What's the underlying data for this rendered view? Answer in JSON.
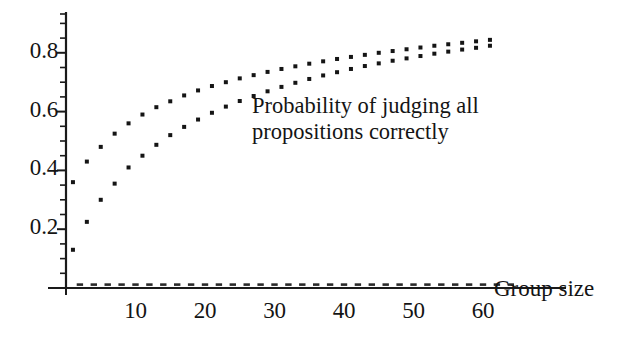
{
  "chart_data": {
    "type": "scatter",
    "title": "",
    "subtitle": "",
    "xlabel": "Group size",
    "ylabel": "",
    "annotation": "Probability of judging all propositions correctly",
    "annotation_lines": [
      "Probability of judging all",
      "propositions correctly"
    ],
    "xlim": [
      0,
      65
    ],
    "ylim": [
      0,
      0.93
    ],
    "xticks": [
      10,
      20,
      30,
      40,
      50,
      60
    ],
    "xtick_labels": [
      "10",
      "20",
      "30",
      "40",
      "50",
      "60"
    ],
    "yticks": [
      0.2,
      0.4,
      0.6,
      0.8
    ],
    "ytick_labels": [
      "0.2",
      "0.4",
      "0.6",
      "0.8"
    ],
    "y_minor_ticks": [
      0.05,
      0.1,
      0.15,
      0.25,
      0.3,
      0.35,
      0.45,
      0.5,
      0.55,
      0.65,
      0.7,
      0.75,
      0.85,
      0.9
    ],
    "grid": false,
    "legend": "none",
    "marker": "square",
    "marker_color": "#151515",
    "marker_size_px": 4,
    "series": [
      {
        "name": "upper",
        "x": [
          1,
          3,
          5,
          7,
          9,
          11,
          13,
          15,
          17,
          19,
          21,
          23,
          25,
          27,
          29,
          31,
          33,
          35,
          37,
          39,
          41,
          43,
          45,
          47,
          49,
          51,
          53,
          55,
          57,
          59,
          61
        ],
        "y": [
          0.36,
          0.43,
          0.48,
          0.525,
          0.56,
          0.59,
          0.615,
          0.635,
          0.655,
          0.672,
          0.687,
          0.7,
          0.713,
          0.724,
          0.735,
          0.745,
          0.754,
          0.763,
          0.771,
          0.779,
          0.786,
          0.793,
          0.8,
          0.806,
          0.812,
          0.818,
          0.824,
          0.829,
          0.834,
          0.839,
          0.844
        ]
      },
      {
        "name": "lower",
        "x": [
          1,
          3,
          5,
          7,
          9,
          11,
          13,
          15,
          17,
          19,
          21,
          23,
          25,
          27,
          29,
          31,
          33,
          35,
          37,
          39,
          41,
          43,
          45,
          47,
          49,
          51,
          53,
          55,
          57,
          59,
          61
        ],
        "y": [
          0.13,
          0.225,
          0.3,
          0.355,
          0.41,
          0.45,
          0.487,
          0.52,
          0.548,
          0.573,
          0.596,
          0.617,
          0.636,
          0.653,
          0.669,
          0.684,
          0.698,
          0.711,
          0.723,
          0.734,
          0.745,
          0.755,
          0.764,
          0.773,
          0.781,
          0.789,
          0.797,
          0.804,
          0.811,
          0.817,
          0.824
        ]
      }
    ]
  }
}
